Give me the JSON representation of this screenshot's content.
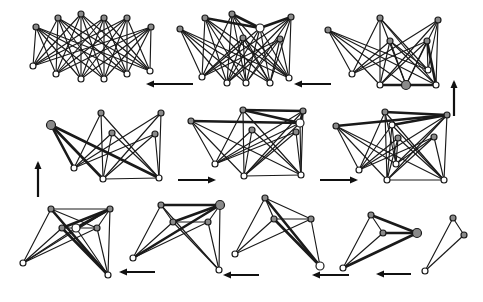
{
  "figure": {
    "caption_fragment": "",
    "layout": "3 rows x 3/3/4 panels, serpentine flow",
    "colors": {
      "edge": "#1a1a1a",
      "node_gray": "#8a8a8a",
      "node_white": "#ffffff",
      "arrow": "#111111"
    }
  },
  "panels": [
    {
      "id": "p1",
      "nodes": [
        {
          "x": 36,
          "y": 27,
          "c": "g"
        },
        {
          "x": 58,
          "y": 18,
          "c": "g"
        },
        {
          "x": 81,
          "y": 14,
          "c": "g"
        },
        {
          "x": 104,
          "y": 18,
          "c": "g"
        },
        {
          "x": 127,
          "y": 18,
          "c": "g"
        },
        {
          "x": 151,
          "y": 27,
          "c": "g"
        },
        {
          "x": 33,
          "y": 66,
          "c": "w"
        },
        {
          "x": 56,
          "y": 74,
          "c": "w"
        },
        {
          "x": 81,
          "y": 79,
          "c": "w"
        },
        {
          "x": 104,
          "y": 79,
          "c": "w"
        },
        {
          "x": 127,
          "y": 74,
          "c": "w"
        },
        {
          "x": 150,
          "y": 71,
          "c": "w"
        }
      ],
      "edges": "bipartite:0-5:6-11",
      "heavy": []
    },
    {
      "id": "p2",
      "nodes": [
        {
          "x": 180,
          "y": 29,
          "c": "g"
        },
        {
          "x": 205,
          "y": 18,
          "c": "g"
        },
        {
          "x": 232,
          "y": 14,
          "c": "g"
        },
        {
          "x": 260,
          "y": 28,
          "c": "w",
          "r": 4
        },
        {
          "x": 291,
          "y": 17,
          "c": "g"
        },
        {
          "x": 243,
          "y": 38,
          "c": "g"
        },
        {
          "x": 280,
          "y": 39,
          "c": "g"
        },
        {
          "x": 202,
          "y": 77,
          "c": "w"
        },
        {
          "x": 227,
          "y": 83,
          "c": "w"
        },
        {
          "x": 246,
          "y": 83,
          "c": "w"
        },
        {
          "x": 270,
          "y": 83,
          "c": "w"
        },
        {
          "x": 289,
          "y": 78,
          "c": "w"
        }
      ],
      "edges": "bipartite:0-6:7-11",
      "heavy": [
        [
          1,
          3
        ],
        [
          2,
          3
        ],
        [
          3,
          4
        ]
      ]
    },
    {
      "id": "p3",
      "nodes": [
        {
          "x": 328,
          "y": 30,
          "c": "g"
        },
        {
          "x": 380,
          "y": 18,
          "c": "g"
        },
        {
          "x": 438,
          "y": 20,
          "c": "g"
        },
        {
          "x": 390,
          "y": 41,
          "c": "g"
        },
        {
          "x": 427,
          "y": 41,
          "c": "g"
        },
        {
          "x": 352,
          "y": 74,
          "c": "w"
        },
        {
          "x": 380,
          "y": 85,
          "c": "w"
        },
        {
          "x": 406,
          "y": 85,
          "c": "g",
          "r": 4.5
        },
        {
          "x": 436,
          "y": 85,
          "c": "w"
        },
        {
          "x": 428,
          "y": 70,
          "c": "w"
        }
      ],
      "edges": "bipartite:0-4:5-9",
      "heavy": [
        [
          6,
          7
        ],
        [
          7,
          8
        ],
        [
          4,
          8
        ]
      ]
    },
    {
      "id": "p4",
      "nodes": [
        {
          "x": 51,
          "y": 125,
          "c": "g",
          "r": 4.5
        },
        {
          "x": 101,
          "y": 113,
          "c": "g"
        },
        {
          "x": 112,
          "y": 133,
          "c": "g"
        },
        {
          "x": 161,
          "y": 113,
          "c": "g"
        },
        {
          "x": 155,
          "y": 134,
          "c": "g"
        },
        {
          "x": 74,
          "y": 168,
          "c": "w"
        },
        {
          "x": 103,
          "y": 179,
          "c": "w"
        },
        {
          "x": 159,
          "y": 178,
          "c": "w"
        }
      ],
      "edges": "bipartite:0-4:5-7",
      "extra": [
        [
          6,
          7
        ]
      ],
      "heavy": [
        [
          0,
          5
        ],
        [
          0,
          6
        ],
        [
          0,
          7
        ]
      ]
    },
    {
      "id": "p5",
      "nodes": [
        {
          "x": 191,
          "y": 121,
          "c": "g"
        },
        {
          "x": 243,
          "y": 110,
          "c": "g"
        },
        {
          "x": 303,
          "y": 111,
          "c": "g"
        },
        {
          "x": 300,
          "y": 123,
          "c": "w",
          "r": 4
        },
        {
          "x": 252,
          "y": 130,
          "c": "g"
        },
        {
          "x": 296,
          "y": 132,
          "c": "g"
        },
        {
          "x": 215,
          "y": 164,
          "c": "w"
        },
        {
          "x": 244,
          "y": 176,
          "c": "w"
        },
        {
          "x": 301,
          "y": 175,
          "c": "w"
        }
      ],
      "edges": "bipartite:0-5:6-8",
      "extra": [
        [
          0,
          3
        ],
        [
          7,
          8
        ]
      ],
      "heavy": [
        [
          1,
          2
        ],
        [
          1,
          3
        ],
        [
          2,
          3
        ],
        [
          0,
          3
        ]
      ]
    },
    {
      "id": "p6",
      "nodes": [
        {
          "x": 336,
          "y": 126,
          "c": "g"
        },
        {
          "x": 385,
          "y": 112,
          "c": "g"
        },
        {
          "x": 447,
          "y": 115,
          "c": "g"
        },
        {
          "x": 392,
          "y": 125,
          "c": "w"
        },
        {
          "x": 398,
          "y": 138,
          "c": "g"
        },
        {
          "x": 434,
          "y": 137,
          "c": "g"
        },
        {
          "x": 359,
          "y": 170,
          "c": "w"
        },
        {
          "x": 396,
          "y": 164,
          "c": "w"
        },
        {
          "x": 387,
          "y": 180,
          "c": "w"
        },
        {
          "x": 444,
          "y": 180,
          "c": "w"
        }
      ],
      "edges": "bipartite:0-5:6-9",
      "extra": [
        [
          0,
          2
        ],
        [
          8,
          9
        ]
      ],
      "heavy": [
        [
          0,
          2
        ],
        [
          1,
          2
        ],
        [
          3,
          2
        ]
      ]
    },
    {
      "id": "p7",
      "nodes": [
        {
          "x": 51,
          "y": 209,
          "c": "g"
        },
        {
          "x": 110,
          "y": 209,
          "c": "g"
        },
        {
          "x": 62,
          "y": 228,
          "c": "g"
        },
        {
          "x": 76,
          "y": 228,
          "c": "w",
          "r": 4
        },
        {
          "x": 97,
          "y": 228,
          "c": "g"
        },
        {
          "x": 23,
          "y": 263,
          "c": "w"
        },
        {
          "x": 108,
          "y": 275,
          "c": "w"
        }
      ],
      "edges": "bipartite:0-4:5-6",
      "extra": [
        [
          0,
          1
        ],
        [
          0,
          4
        ],
        [
          2,
          1
        ],
        [
          3,
          1
        ],
        [
          4,
          1
        ],
        [
          2,
          4
        ]
      ],
      "heavy": [
        [
          2,
          1
        ],
        [
          3,
          1
        ],
        [
          0,
          6
        ],
        [
          2,
          6
        ]
      ]
    },
    {
      "id": "p8",
      "nodes": [
        {
          "x": 161,
          "y": 205,
          "c": "g"
        },
        {
          "x": 220,
          "y": 205,
          "c": "g",
          "r": 4.5
        },
        {
          "x": 173,
          "y": 222,
          "c": "g"
        },
        {
          "x": 208,
          "y": 222,
          "c": "g"
        },
        {
          "x": 133,
          "y": 258,
          "c": "w"
        },
        {
          "x": 219,
          "y": 270,
          "c": "w"
        }
      ],
      "edges": "bipartite:0-3:4-5",
      "extra": [
        [
          0,
          1
        ],
        [
          0,
          2
        ],
        [
          2,
          1
        ],
        [
          2,
          3
        ],
        [
          3,
          1
        ]
      ],
      "heavy": [
        [
          4,
          1
        ],
        [
          2,
          1
        ],
        [
          0,
          1
        ]
      ]
    },
    {
      "id": "p9",
      "nodes": [
        {
          "x": 265,
          "y": 198,
          "c": "g"
        },
        {
          "x": 274,
          "y": 219,
          "c": "g"
        },
        {
          "x": 311,
          "y": 219,
          "c": "g"
        },
        {
          "x": 235,
          "y": 254,
          "c": "w"
        },
        {
          "x": 320,
          "y": 266,
          "c": "w",
          "r": 4
        }
      ],
      "edges": "bipartite:0-2:3-4",
      "extra": [
        [
          0,
          1
        ],
        [
          0,
          2
        ],
        [
          1,
          2
        ]
      ],
      "heavy": [
        [
          0,
          4
        ],
        [
          1,
          4
        ]
      ]
    },
    {
      "id": "p10",
      "nodes": [
        {
          "x": 371,
          "y": 215,
          "c": "g"
        },
        {
          "x": 383,
          "y": 233,
          "c": "g"
        },
        {
          "x": 417,
          "y": 233,
          "c": "g",
          "r": 4.5
        },
        {
          "x": 343,
          "y": 268,
          "c": "w"
        }
      ],
      "edges": "bipartite:0-2:3-3",
      "extra": [
        [
          0,
          1
        ],
        [
          0,
          2
        ],
        [
          1,
          2
        ]
      ],
      "heavy": [
        [
          0,
          2
        ],
        [
          1,
          2
        ],
        [
          3,
          2
        ]
      ]
    },
    {
      "id": "p11",
      "nodes": [
        {
          "x": 453,
          "y": 218,
          "c": "g"
        },
        {
          "x": 464,
          "y": 235,
          "c": "g"
        },
        {
          "x": 425,
          "y": 271,
          "c": "w"
        }
      ],
      "edges": "bipartite:0-1:2-2",
      "extra": [
        [
          0,
          1
        ]
      ],
      "heavy": []
    }
  ],
  "arrows": [
    {
      "id": "a1",
      "dir": "left",
      "x1": 193,
      "y1": 84,
      "x2": 148,
      "y2": 84
    },
    {
      "id": "a2",
      "dir": "left",
      "x1": 331,
      "y1": 84,
      "x2": 296,
      "y2": 84
    },
    {
      "id": "a3",
      "dir": "up",
      "x1": 454,
      "y1": 116,
      "x2": 454,
      "y2": 82
    },
    {
      "id": "a4",
      "dir": "up",
      "x1": 38,
      "y1": 197,
      "x2": 38,
      "y2": 163
    },
    {
      "id": "a5",
      "dir": "right",
      "x1": 178,
      "y1": 180,
      "x2": 214,
      "y2": 180
    },
    {
      "id": "a6",
      "dir": "right",
      "x1": 320,
      "y1": 180,
      "x2": 356,
      "y2": 180
    },
    {
      "id": "a7",
      "dir": "left",
      "x1": 155,
      "y1": 272,
      "x2": 121,
      "y2": 272
    },
    {
      "id": "a8",
      "dir": "left",
      "x1": 259,
      "y1": 275,
      "x2": 225,
      "y2": 275
    },
    {
      "id": "a9",
      "dir": "left",
      "x1": 349,
      "y1": 275,
      "x2": 314,
      "y2": 275
    },
    {
      "id": "a10",
      "dir": "left",
      "x1": 411,
      "y1": 274,
      "x2": 378,
      "y2": 274
    }
  ]
}
